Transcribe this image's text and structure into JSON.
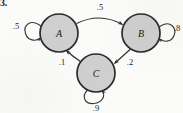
{
  "figure": {
    "problem_number": "3.",
    "type": "markov-chain-state-diagram"
  },
  "nodes": [
    {
      "id": "A",
      "label": "A",
      "cx": 59,
      "cy": 33,
      "r": 19
    },
    {
      "id": "B",
      "label": "B",
      "cx": 141,
      "cy": 33,
      "r": 19
    },
    {
      "id": "C",
      "label": "C",
      "cx": 96,
      "cy": 73,
      "r": 19
    }
  ],
  "edges": [
    {
      "from": "A",
      "to": "B",
      "weight": ".5",
      "label_x": 100,
      "label_y": 7
    },
    {
      "from": "C",
      "to": "A",
      "weight": ".1",
      "label_x": 62,
      "label_y": 62
    },
    {
      "from": "B",
      "to": "C",
      "weight": ".2",
      "label_x": 130,
      "label_y": 62
    }
  ],
  "self_loops": [
    {
      "node": "A",
      "weight": ".5",
      "side": "left",
      "label_x": 16,
      "label_y": 26
    },
    {
      "node": "B",
      "weight": ".8",
      "side": "right",
      "label_x": 176,
      "label_y": 28
    },
    {
      "node": "C",
      "weight": ".9",
      "side": "bottom",
      "label_x": 96,
      "label_y": 108
    }
  ],
  "colors": {
    "node_fill": "#cfcfcf",
    "node_stroke": "#2b2b2b",
    "edge_stroke": "#2f2f2f",
    "text": "#1a1a1a",
    "background": "#fbfbfa"
  }
}
